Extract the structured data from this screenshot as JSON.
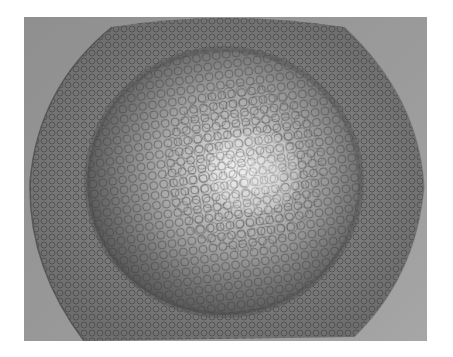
{
  "image": {
    "subject": "Deformed sheet-metal dome with printed circle grid",
    "description": "Grayscale photograph of a circular sheet blank with a hemispherical stretched dome in the center; a square circle-grid pattern covers the flange and dome, with circles enlarged near the bright pole",
    "colors": {
      "background": "#ffffff",
      "photo_backdrop": "#9a9a9a",
      "flange": "#7d7d7d",
      "dome_shadow_ring": "#5e5e5e",
      "dome_highlight": "#e6e6e6",
      "grid_line": "#4a4a4a"
    }
  }
}
